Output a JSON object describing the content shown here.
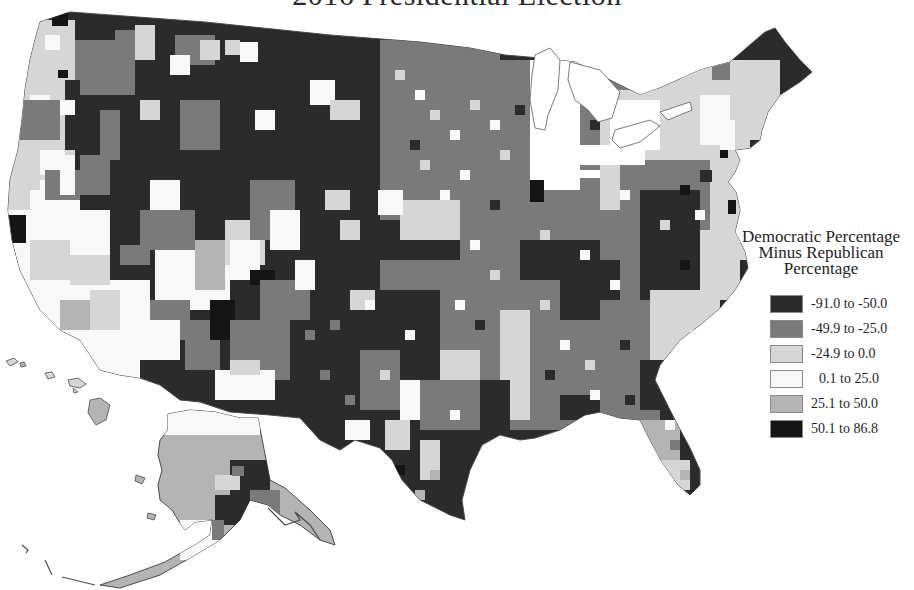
{
  "title": "2016 Presidential Election",
  "legend": {
    "title_lines": [
      "Democratic Percentage",
      "Minus Republican",
      "Percentage"
    ],
    "items": [
      {
        "label": "-91.0 to -50.0",
        "color": "#2b2b2b"
      },
      {
        "label": "-49.9 to -25.0",
        "color": "#7a7a7a"
      },
      {
        "label": "-24.9 to 0.0",
        "color": "#d6d6d6"
      },
      {
        "label": "0.1 to 25.0",
        "color": "#f8f8f8"
      },
      {
        "label": "25.1 to 50.0",
        "color": "#b4b4b4"
      },
      {
        "label": "50.1 to 86.8",
        "color": "#151515"
      }
    ]
  },
  "map": {
    "type": "choropleth",
    "geography": "US counties",
    "insets": [
      "Alaska",
      "Hawaii"
    ],
    "palette": {
      "rep_strong": "#2b2b2b",
      "rep_mid": "#7a7a7a",
      "rep_lean": "#d6d6d6",
      "dem_lean": "#f8f8f8",
      "dem_mid": "#b4b4b4",
      "dem_strong": "#151515",
      "border": "#5a5a5a"
    }
  }
}
